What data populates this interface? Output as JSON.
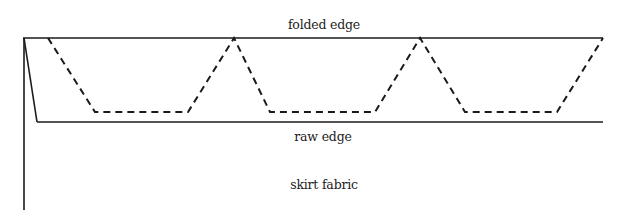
{
  "diagram": {
    "type": "hem-stitch diagram",
    "labels": {
      "folded_edge": "folded edge",
      "raw_edge": "raw edge",
      "skirt_fabric": "skirt fabric"
    },
    "colors": {
      "line": "#1a1a1a",
      "text": "#222222",
      "background": "#ffffff"
    },
    "geometry": {
      "folded_edge_y": 38,
      "raw_edge_y": 122,
      "left_x": 24,
      "right_x": 603,
      "stitch_bottom_y": 112,
      "stitch_path_points": [
        [
          48,
          38
        ],
        [
          95,
          112
        ],
        [
          188,
          112
        ],
        [
          234,
          38
        ],
        [
          270,
          112
        ],
        [
          375,
          112
        ],
        [
          420,
          38
        ],
        [
          465,
          112
        ],
        [
          557,
          112
        ],
        [
          603,
          38
        ]
      ]
    }
  }
}
